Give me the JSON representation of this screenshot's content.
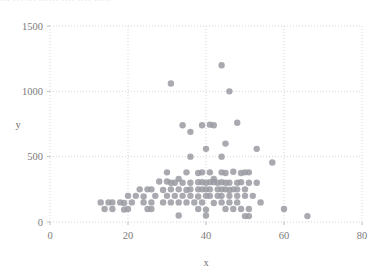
{
  "top_text": "··· ··· ··· ······ ···· ···· ·····",
  "chart_data": {
    "type": "scatter",
    "title": "",
    "xlabel": "x",
    "ylabel": "y",
    "xlim": [
      0,
      80
    ],
    "ylim": [
      0,
      1500
    ],
    "xticks": [
      0,
      20,
      40,
      60,
      80
    ],
    "yticks": [
      0,
      500,
      1000,
      1500
    ],
    "grid": true,
    "grid_style": "dotted",
    "grid_color": "#cfcfd6",
    "marker": {
      "shape": "circle",
      "color": "#9a9aa2",
      "size": 3.2
    },
    "legend": null,
    "points": [
      [
        31,
        1060
      ],
      [
        44,
        1200
      ],
      [
        46,
        1000
      ],
      [
        34,
        740
      ],
      [
        36,
        690
      ],
      [
        39,
        740
      ],
      [
        41,
        745
      ],
      [
        42,
        740
      ],
      [
        48,
        760
      ],
      [
        40,
        560
      ],
      [
        45,
        600
      ],
      [
        53,
        560
      ],
      [
        57,
        455
      ],
      [
        36,
        500
      ],
      [
        44,
        500
      ],
      [
        30,
        380
      ],
      [
        33,
        330
      ],
      [
        35,
        380
      ],
      [
        38,
        375
      ],
      [
        39,
        380
      ],
      [
        41,
        380
      ],
      [
        42,
        330
      ],
      [
        44,
        380
      ],
      [
        45,
        375
      ],
      [
        47,
        385
      ],
      [
        49,
        375
      ],
      [
        50,
        380
      ],
      [
        51,
        380
      ],
      [
        28,
        310
      ],
      [
        30,
        310
      ],
      [
        31,
        300
      ],
      [
        32,
        300
      ],
      [
        34,
        300
      ],
      [
        36,
        300
      ],
      [
        38,
        305
      ],
      [
        39,
        305
      ],
      [
        40,
        300
      ],
      [
        41,
        305
      ],
      [
        42,
        305
      ],
      [
        43,
        300
      ],
      [
        44,
        305
      ],
      [
        45,
        300
      ],
      [
        46,
        300
      ],
      [
        48,
        300
      ],
      [
        49,
        305
      ],
      [
        51,
        300
      ],
      [
        53,
        300
      ],
      [
        23,
        250
      ],
      [
        25,
        250
      ],
      [
        26,
        250
      ],
      [
        29,
        245
      ],
      [
        31,
        250
      ],
      [
        33,
        250
      ],
      [
        35,
        245
      ],
      [
        36,
        250
      ],
      [
        38,
        250
      ],
      [
        39,
        250
      ],
      [
        40,
        250
      ],
      [
        41,
        250
      ],
      [
        43,
        250
      ],
      [
        44,
        250
      ],
      [
        45,
        250
      ],
      [
        46,
        245
      ],
      [
        47,
        250
      ],
      [
        48,
        250
      ],
      [
        50,
        250
      ],
      [
        20,
        200
      ],
      [
        22,
        200
      ],
      [
        24,
        195
      ],
      [
        27,
        200
      ],
      [
        30,
        200
      ],
      [
        32,
        200
      ],
      [
        34,
        200
      ],
      [
        36,
        200
      ],
      [
        38,
        195
      ],
      [
        40,
        200
      ],
      [
        41,
        200
      ],
      [
        43,
        200
      ],
      [
        44,
        200
      ],
      [
        46,
        200
      ],
      [
        48,
        200
      ],
      [
        50,
        200
      ],
      [
        52,
        200
      ],
      [
        13,
        150
      ],
      [
        15,
        150
      ],
      [
        16,
        150
      ],
      [
        18,
        150
      ],
      [
        19,
        145
      ],
      [
        21,
        150
      ],
      [
        24,
        150
      ],
      [
        26,
        150
      ],
      [
        29,
        150
      ],
      [
        31,
        150
      ],
      [
        33,
        150
      ],
      [
        35,
        150
      ],
      [
        37,
        150
      ],
      [
        39,
        150
      ],
      [
        42,
        145
      ],
      [
        44,
        150
      ],
      [
        46,
        150
      ],
      [
        48,
        150
      ],
      [
        54,
        150
      ],
      [
        14,
        100
      ],
      [
        16,
        100
      ],
      [
        19,
        95
      ],
      [
        20,
        100
      ],
      [
        25,
        100
      ],
      [
        26,
        100
      ],
      [
        38,
        100
      ],
      [
        40,
        95
      ],
      [
        45,
        100
      ],
      [
        47,
        100
      ],
      [
        49,
        100
      ],
      [
        51,
        100
      ],
      [
        60,
        100
      ],
      [
        33,
        50
      ],
      [
        40,
        50
      ],
      [
        50,
        45
      ],
      [
        51,
        45
      ],
      [
        66,
        45
      ]
    ]
  }
}
